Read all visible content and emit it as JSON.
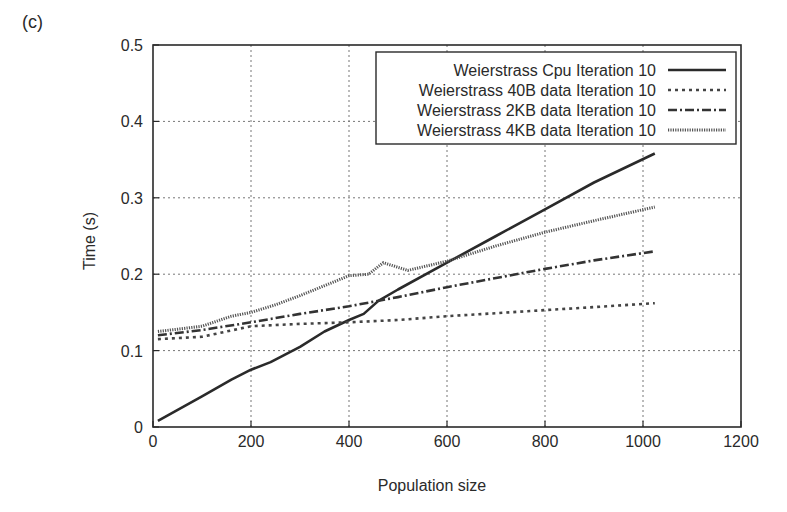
{
  "panel_label": "(c)",
  "chart_data": {
    "type": "line",
    "title": "",
    "xlabel": "Population size",
    "ylabel": "Time (s)",
    "xlim": [
      0,
      1200
    ],
    "ylim": [
      0,
      0.5
    ],
    "xticks": [
      0,
      200,
      400,
      600,
      800,
      1000,
      1200
    ],
    "yticks": [
      0,
      0.1,
      0.2,
      0.3,
      0.4,
      0.5
    ],
    "xtick_labels": [
      "0",
      "200",
      "400",
      "600",
      "800",
      "1000",
      "1200"
    ],
    "ytick_labels": [
      "0",
      "0.1",
      "0.2",
      "0.3",
      "0.4",
      "0.5"
    ],
    "grid": true,
    "legend_position": "upper right",
    "series": [
      {
        "name": "Weierstrass Cpu Iteration 10",
        "style": "solid",
        "x": [
          10,
          100,
          160,
          200,
          240,
          300,
          350,
          400,
          430,
          460,
          500,
          600,
          700,
          800,
          900,
          1024
        ],
        "values": [
          0.008,
          0.04,
          0.062,
          0.075,
          0.085,
          0.105,
          0.125,
          0.14,
          0.148,
          0.165,
          0.18,
          0.215,
          0.25,
          0.285,
          0.32,
          0.358
        ]
      },
      {
        "name": "Weierstrass 40B data Iteration 10",
        "style": "dotted",
        "x": [
          10,
          100,
          150,
          200,
          300,
          400,
          500,
          600,
          700,
          800,
          900,
          1024
        ],
        "values": [
          0.115,
          0.118,
          0.125,
          0.132,
          0.135,
          0.137,
          0.14,
          0.145,
          0.149,
          0.153,
          0.157,
          0.162
        ]
      },
      {
        "name": "Weierstrass 2KB data Iteration 10",
        "style": "dash-dot",
        "x": [
          10,
          100,
          200,
          300,
          400,
          500,
          600,
          700,
          800,
          900,
          1024
        ],
        "values": [
          0.12,
          0.127,
          0.137,
          0.148,
          0.158,
          0.17,
          0.183,
          0.195,
          0.207,
          0.218,
          0.23
        ]
      },
      {
        "name": "Weierstrass 4KB data Iteration 10",
        "style": "fine-dotted",
        "x": [
          10,
          50,
          100,
          160,
          200,
          250,
          300,
          350,
          400,
          440,
          470,
          520,
          600,
          700,
          800,
          900,
          1024
        ],
        "values": [
          0.125,
          0.128,
          0.132,
          0.145,
          0.15,
          0.16,
          0.172,
          0.185,
          0.198,
          0.2,
          0.215,
          0.205,
          0.217,
          0.237,
          0.255,
          0.27,
          0.288
        ]
      }
    ]
  }
}
